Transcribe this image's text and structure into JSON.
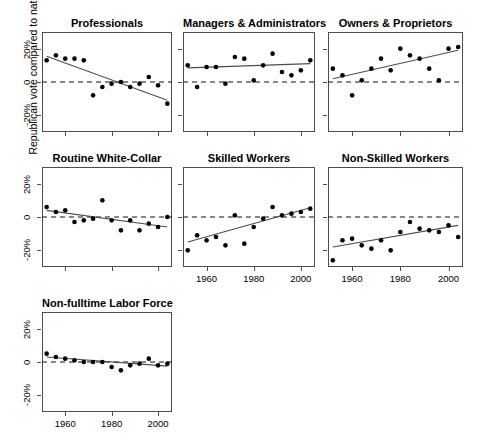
{
  "figure": {
    "ylabel": "Republican vote compared to national average",
    "ytick_labels": [
      "20%",
      "0",
      "-20%"
    ],
    "ytick_values": [
      20,
      0,
      -20
    ],
    "xtick_labels": [
      "1960",
      "1980",
      "2000"
    ],
    "xtick_values": [
      1960,
      1980,
      2000
    ],
    "xlim": [
      1950,
      2006
    ],
    "ylim": [
      -30,
      30
    ],
    "line_color": "#4d4d4d",
    "point_color": "#000000",
    "ref_line_value": 0
  },
  "chart_data": {
    "type": "scatter",
    "title": "",
    "xlabel": "",
    "ylabel": "Republican vote compared to national average",
    "xlim": [
      1950,
      2006
    ],
    "ylim": [
      -30,
      30
    ],
    "xticks": [
      1960,
      1980,
      2000
    ],
    "yticks": [
      -20,
      0,
      20
    ],
    "grid": false,
    "legend": "none",
    "annotations": [
      "dashed horizontal reference line at 0",
      "solid least-squares regression line per panel"
    ],
    "panels": [
      {
        "name": "Professionals",
        "row": 0,
        "col": 0,
        "x": [
          1952,
          1956,
          1960,
          1964,
          1968,
          1972,
          1976,
          1980,
          1984,
          1988,
          1992,
          1996,
          2000,
          2004
        ],
        "y": [
          13,
          16,
          14,
          14,
          13,
          -8,
          -3,
          -1,
          0,
          -3,
          -1,
          3,
          -2,
          -13
        ],
        "fit": {
          "x": [
            1952,
            2004
          ],
          "y": [
            15.5,
            -11.0
          ]
        }
      },
      {
        "name": "Managers & Administrators",
        "row": 0,
        "col": 1,
        "x": [
          1952,
          1956,
          1960,
          1964,
          1968,
          1972,
          1976,
          1980,
          1984,
          1988,
          1992,
          1996,
          2000,
          2004
        ],
        "y": [
          10,
          -3,
          9,
          9,
          -1,
          15,
          14,
          1,
          10,
          17,
          6,
          4,
          7,
          13
        ],
        "fit": {
          "x": [
            1952,
            2004
          ],
          "y": [
            8.5,
            11.0
          ]
        }
      },
      {
        "name": "Owners & Proprietors",
        "row": 0,
        "col": 2,
        "x": [
          1952,
          1956,
          1960,
          1964,
          1968,
          1972,
          1976,
          1980,
          1984,
          1988,
          1992,
          1996,
          2000,
          2004
        ],
        "y": [
          8,
          4,
          -8,
          1,
          8,
          14,
          7,
          20,
          16,
          14,
          8,
          1,
          20,
          21
        ],
        "fit": {
          "x": [
            1952,
            2004
          ],
          "y": [
            2.0,
            19.0
          ]
        }
      },
      {
        "name": "Routine White-Collar",
        "row": 1,
        "col": 0,
        "x": [
          1952,
          1956,
          1960,
          1964,
          1968,
          1972,
          1976,
          1980,
          1984,
          1988,
          1992,
          1996,
          2000,
          2004
        ],
        "y": [
          6,
          3,
          4,
          -3,
          -2,
          -1,
          10,
          -2,
          -8,
          -2,
          -8,
          -4,
          -6,
          0
        ],
        "fit": {
          "x": [
            1952,
            2004
          ],
          "y": [
            4.0,
            -6.0
          ]
        }
      },
      {
        "name": "Skilled Workers",
        "row": 1,
        "col": 1,
        "x": [
          1952,
          1956,
          1960,
          1964,
          1968,
          1972,
          1976,
          1980,
          1984,
          1988,
          1992,
          1996,
          2000,
          2004
        ],
        "y": [
          -20,
          -11,
          -14,
          -12,
          -17,
          1,
          -16,
          -6,
          -1,
          6,
          1,
          2,
          3,
          5
        ],
        "fit": {
          "x": [
            1952,
            2004
          ],
          "y": [
            -15.0,
            5.5
          ]
        }
      },
      {
        "name": "Non-Skilled Workers",
        "row": 1,
        "col": 2,
        "x": [
          1952,
          1956,
          1960,
          1964,
          1968,
          1972,
          1976,
          1980,
          1984,
          1988,
          1992,
          1996,
          2000,
          2004
        ],
        "y": [
          -26,
          -14,
          -13,
          -17,
          -19,
          -14,
          -20,
          -9,
          -3,
          -7,
          -8,
          -9,
          -5,
          -12
        ],
        "fit": {
          "x": [
            1952,
            2004
          ],
          "y": [
            -18.0,
            -5.0
          ]
        }
      },
      {
        "name": "Non-fulltime Labor Force",
        "row": 2,
        "col": 0,
        "x": [
          1952,
          1956,
          1960,
          1964,
          1968,
          1972,
          1976,
          1980,
          1984,
          1988,
          1992,
          1996,
          2000,
          2004
        ],
        "y": [
          5,
          3,
          2,
          1,
          0,
          0,
          0,
          -3,
          -5,
          -2,
          -1,
          2,
          -2,
          -1
        ],
        "fit": {
          "x": [
            1952,
            2004
          ],
          "y": [
            3.0,
            -2.5
          ]
        }
      }
    ]
  }
}
